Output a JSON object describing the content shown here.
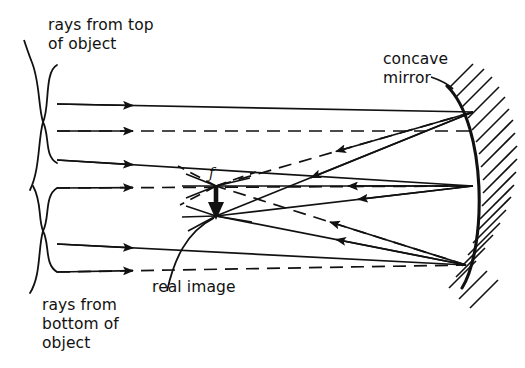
{
  "figure": {
    "background_color": "#ffffff",
    "ink_color": "#111111",
    "labels": {
      "rays_from_top": "rays from top\nof object",
      "rays_from_bottom": "rays from\nbottom of\nobject",
      "concave_mirror": "concave\nmirror",
      "real_image": "real image",
      "focal_point": "f"
    },
    "annotations": {
      "brace_top_name": "brace grouping rays from top of object",
      "brace_bottom_name": "brace grouping rays from bottom of object",
      "leader_real_image": "curved leader from real image text to image point",
      "leader_concave_mirror": "short leader from concave mirror text to mirror surface"
    },
    "optics": {
      "mirror_type": "concave",
      "mirror_vertex": [
        483,
        185
      ],
      "mirror_top_edge": [
        447,
        86
      ],
      "mirror_bottom_edge": [
        462,
        288
      ],
      "image_type": "real",
      "image_top_point": [
        216,
        186
      ],
      "image_bottom_point": [
        216,
        216
      ],
      "focal_point_marker": [
        216,
        186
      ],
      "incoming_ray_start_x": 57,
      "ray_style_solid": "solid ray",
      "ray_style_dashed": "dashed construction ray",
      "incoming_arrow_direction": "rightward",
      "reflected_arrow_direction": "leftward"
    }
  }
}
